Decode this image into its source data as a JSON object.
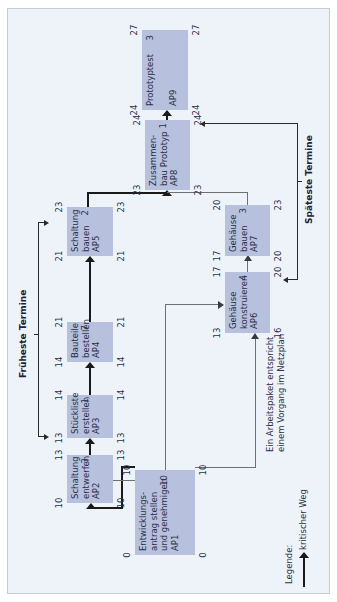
{
  "diagram": {
    "type": "Netzplan",
    "labels": {
      "earliest": "Früheste Termine",
      "latest": "Späteste Termine",
      "note_line1": "Ein Arbeitspaket entspricht",
      "note_line2": "einem Vorgang im Netzplan",
      "legend_title": "Legende:",
      "legend_item": "kritischer Weg"
    },
    "work_packages": [
      {
        "id": "AP1",
        "name": "Entwicklungs-\nantrag stellen\nund genehmigen",
        "duration": "10",
        "fez_start": "0",
        "fez_end": "10",
        "sez_start": "0",
        "sez_end": "10"
      },
      {
        "id": "AP2",
        "name": "Schaltung\nentwerfen",
        "duration": "3",
        "fez_start": "10",
        "fez_end": "13",
        "sez_start": "10",
        "sez_end": "13"
      },
      {
        "id": "AP3",
        "name": "Stückliste\nerstellen",
        "duration": "1",
        "fez_start": "13",
        "fez_end": "14",
        "sez_start": "13",
        "sez_end": "14"
      },
      {
        "id": "AP4",
        "name": "Bauteile\nbestellen",
        "duration": "7",
        "fez_start": "14",
        "fez_end": "21",
        "sez_start": "14",
        "sez_end": "21"
      },
      {
        "id": "AP5",
        "name": "Schaltung\nbauen",
        "duration": "2",
        "fez_start": "21",
        "fez_end": "23",
        "sez_start": "21",
        "sez_end": "23"
      },
      {
        "id": "AP6",
        "name": "Gehäuse\nkonstruieren",
        "duration": "4",
        "fez_start": "13",
        "fez_end": "17",
        "sez_start": "16",
        "sez_end": "20"
      },
      {
        "id": "AP7",
        "name": "Gehäuse\nbauen",
        "duration": "3",
        "fez_start": "17",
        "fez_end": "20",
        "sez_start": "20",
        "sez_end": "23"
      },
      {
        "id": "AP8",
        "name": "Zusammen-\nbau Prototyp",
        "duration": "1",
        "fez_start": "23",
        "fez_end": "24",
        "sez_start": "23",
        "sez_end": "24"
      },
      {
        "id": "AP9",
        "name": "Prototyptest",
        "duration": "3",
        "fez_start": "24",
        "fez_end": "27",
        "sez_start": "24",
        "sez_end": "27"
      }
    ],
    "colors": {
      "panel_bg": "#eef3fa",
      "box_fill": "#b7c1de",
      "critical_path": "#1a1a1a",
      "normal_path": "#6f6f6f"
    }
  }
}
